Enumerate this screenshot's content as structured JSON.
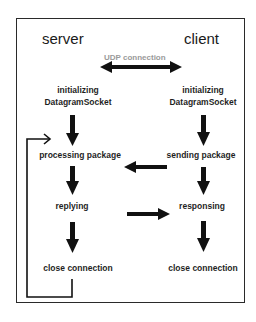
{
  "diagram": {
    "type": "udp-client-server-flow",
    "colors": {
      "frame": "#2a2a2a",
      "text": "#1f1f1f",
      "udp_label": "#9a9a9a",
      "arrow": "#111111"
    },
    "headings": {
      "server": "server",
      "client": "client"
    },
    "connection_label": "UDP connection",
    "server_steps": [
      {
        "line1": "initializing",
        "line2": "DatagramSocket"
      },
      {
        "label": "processing package"
      },
      {
        "label": "replying"
      },
      {
        "label": "close connection"
      }
    ],
    "client_steps": [
      {
        "line1": "initializing",
        "line2": "DatagramSocket"
      },
      {
        "label": "sending package"
      },
      {
        "label": "responsing"
      },
      {
        "label": "close connection"
      }
    ],
    "edges": [
      {
        "from": "server.initializing",
        "to": "server.processing package",
        "style": "down-arrow"
      },
      {
        "from": "server.processing package",
        "to": "server.replying",
        "style": "down-arrow"
      },
      {
        "from": "server.replying",
        "to": "server.close connection",
        "style": "down-arrow"
      },
      {
        "from": "client.initializing",
        "to": "client.sending package",
        "style": "down-arrow"
      },
      {
        "from": "client.sending package",
        "to": "client.responsing",
        "style": "down-arrow"
      },
      {
        "from": "client.responsing",
        "to": "client.close connection",
        "style": "down-arrow"
      },
      {
        "from": "client.sending package",
        "to": "server.processing package",
        "style": "left-arrow"
      },
      {
        "from": "server.replying",
        "to": "client.responsing",
        "style": "right-arrow"
      },
      {
        "from": "server.close connection",
        "to": "server.processing package",
        "style": "loop-back"
      },
      {
        "from": "server",
        "to": "client",
        "style": "double-arrow",
        "label": "UDP connection"
      }
    ]
  }
}
